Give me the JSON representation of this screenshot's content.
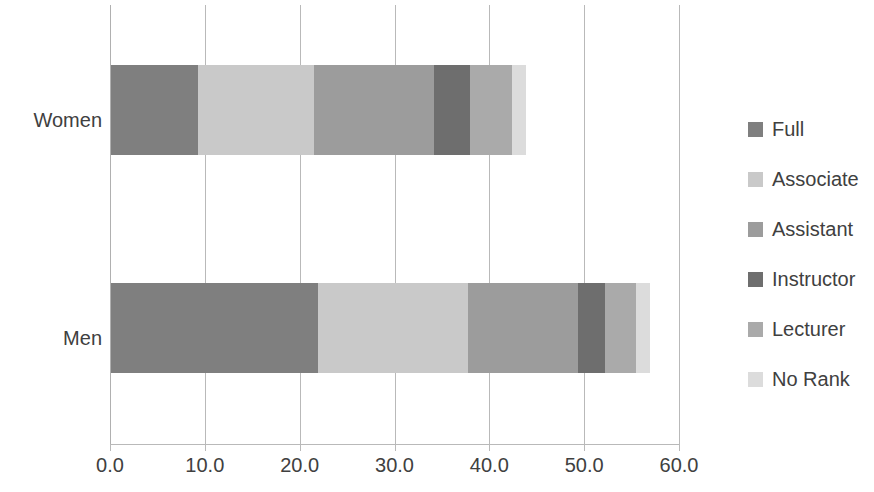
{
  "chart_data": {
    "type": "bar",
    "orientation": "horizontal",
    "stacked": true,
    "title": "",
    "subtitle": "",
    "xlabel": "",
    "ylabel": "",
    "categories": [
      "Women",
      "Men"
    ],
    "xlim": [
      0.0,
      60.0
    ],
    "xticks": [
      0.0,
      10.0,
      20.0,
      30.0,
      40.0,
      50.0,
      60.0
    ],
    "xtick_labels": [
      "0.0",
      "10.0",
      "20.0",
      "30.0",
      "40.0",
      "50.0",
      "60.0"
    ],
    "grid": true,
    "grid_axis": "x",
    "legend_position": "right",
    "series": [
      {
        "name": "Full",
        "color": "#7f7f7f",
        "values": [
          9.2,
          21.8
        ]
      },
      {
        "name": "Associate",
        "color": "#c9c9c9",
        "values": [
          12.2,
          15.8
        ]
      },
      {
        "name": "Assistant",
        "color": "#9c9c9c",
        "values": [
          12.7,
          11.6
        ]
      },
      {
        "name": "Instructor",
        "color": "#6e6e6e",
        "values": [
          3.8,
          2.9
        ]
      },
      {
        "name": "Lecturer",
        "color": "#aaaaaa",
        "values": [
          4.4,
          3.3
        ]
      },
      {
        "name": "No Rank",
        "color": "#dcdcdc",
        "values": [
          1.5,
          1.4
        ]
      }
    ],
    "totals": [
      43.8,
      56.8
    ],
    "annotations": []
  },
  "axis": {
    "tick_labels": [
      "0.0",
      "10.0",
      "20.0",
      "30.0",
      "40.0",
      "50.0",
      "60.0"
    ]
  },
  "categories": {
    "women": "Women",
    "men": "Men"
  },
  "legend": {
    "items": [
      {
        "label": "Full"
      },
      {
        "label": "Associate"
      },
      {
        "label": "Assistant"
      },
      {
        "label": "Instructor"
      },
      {
        "label": "Lecturer"
      },
      {
        "label": "No Rank"
      }
    ]
  },
  "colors": {
    "gridline": "#b9b9b9",
    "text": "#404040",
    "background": "#ffffff"
  }
}
